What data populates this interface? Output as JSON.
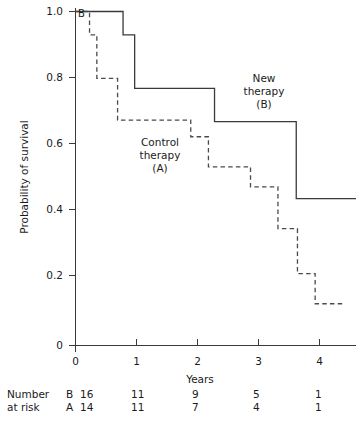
{
  "chart_data": {
    "type": "line",
    "subtype": "kaplan-meier-step",
    "title": "",
    "xlabel": "Years",
    "ylabel": "Probability of survival",
    "xlim": [
      0,
      4.6
    ],
    "ylim": [
      0,
      1.0
    ],
    "grid": false,
    "legend": "in-plot annotations",
    "xticks": [
      "0",
      "1",
      "2",
      "3",
      "4"
    ],
    "xtick_values": [
      0,
      1,
      2,
      3,
      4
    ],
    "yticks": [
      "0",
      "0.2",
      "0.4",
      "0.6",
      "0.8",
      "1.0"
    ],
    "ytick_values": [
      0,
      0.2,
      0.4,
      0.6,
      0.8,
      1.0
    ],
    "series": [
      {
        "name": "New therapy (B)",
        "arm": "B",
        "style": "solid",
        "color": "#3a3a3a",
        "annotation": [
          "New",
          "therapy",
          "(B)"
        ],
        "start_label": "B",
        "x": [
          0.0,
          0.78,
          0.97,
          2.28,
          3.62,
          4.6
        ],
        "y": [
          1.0,
          0.93,
          0.77,
          0.67,
          0.44,
          0.44
        ]
      },
      {
        "name": "Control therapy (A)",
        "arm": "A",
        "style": "dashed",
        "color": "#4a4a4a",
        "annotation": [
          "Control",
          "therapy",
          "(A)"
        ],
        "x": [
          0.0,
          0.23,
          0.35,
          0.69,
          1.89,
          2.18,
          2.87,
          3.32,
          3.64,
          3.93,
          4.4
        ],
        "y": [
          1.0,
          0.93,
          0.8,
          0.675,
          0.625,
          0.535,
          0.475,
          0.35,
          0.215,
          0.125,
          0.125
        ]
      }
    ],
    "annotations": [
      {
        "text_lines": [
          "New",
          "therapy",
          "(B)"
        ],
        "x": 3.1,
        "y": 0.855
      },
      {
        "text_lines": [
          "Control",
          "therapy",
          "(A)"
        ],
        "x": 1.4,
        "y": 0.605
      }
    ]
  },
  "risk_table": {
    "row_label_lines": [
      "Number",
      "at risk"
    ],
    "time_points": [
      "0",
      "1",
      "2",
      "3",
      "4"
    ],
    "rows": [
      {
        "label": "Number",
        "arm": "B",
        "values": [
          "16",
          "11",
          "9",
          "5",
          "1"
        ]
      },
      {
        "label": "at risk",
        "arm": "A",
        "values": [
          "14",
          "11",
          "7",
          "4",
          "1"
        ]
      }
    ]
  }
}
